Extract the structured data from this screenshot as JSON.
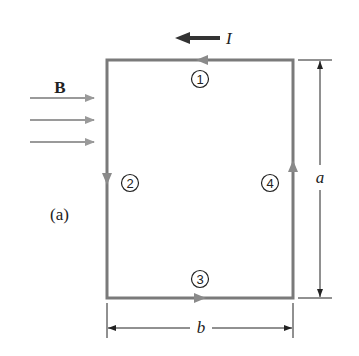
{
  "figure": {
    "panel_label": "(a)",
    "current_label": "I",
    "field_label": "B",
    "height_label": "a",
    "width_label": "b",
    "segments": [
      {
        "number": "1",
        "side": "top",
        "current_direction": "left"
      },
      {
        "number": "2",
        "side": "left",
        "current_direction": "down"
      },
      {
        "number": "3",
        "side": "bottom",
        "current_direction": "right"
      },
      {
        "number": "4",
        "side": "right",
        "current_direction": "up"
      }
    ],
    "field_arrows": 3,
    "colors": {
      "loop": "#7a7a7a",
      "field_arrows": "#9a9a9a",
      "current_arrow": "#333333",
      "dimension_lines": "#222222",
      "text": "#222222"
    }
  }
}
